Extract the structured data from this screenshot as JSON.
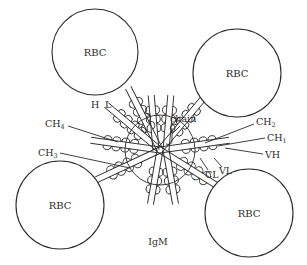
{
  "diagram": {
    "cells": [
      {
        "label": "RBC",
        "cx": 95,
        "cy": 52,
        "r": 43
      },
      {
        "label": "RBC",
        "cx": 237,
        "cy": 73,
        "r": 44
      },
      {
        "label": "RBC",
        "cx": 60,
        "cy": 205,
        "r": 44
      },
      {
        "label": "RBC",
        "cx": 249,
        "cy": 213,
        "r": 44
      }
    ],
    "labels": {
      "heavy": "H",
      "light": "L",
      "j_chain": "chain",
      "ch4": {
        "base": "CH",
        "sub": "4"
      },
      "ch3": {
        "base": "CH",
        "sub": "3"
      },
      "ch2": {
        "base": "CH",
        "sub": "2"
      },
      "ch1": {
        "base": "CH",
        "sub": "1"
      },
      "vh": "VH",
      "cl": "CL",
      "vl": "VL",
      "molecule": "IgM"
    },
    "colors": {
      "line": "#2a2a2a",
      "background": "#ffffff"
    }
  }
}
